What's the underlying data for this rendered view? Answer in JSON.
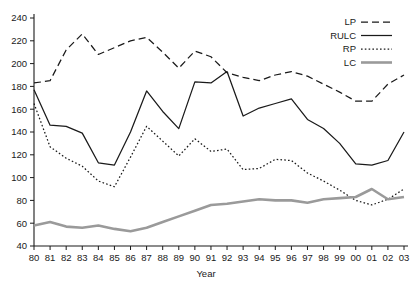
{
  "chart_data": {
    "type": "line",
    "title": "",
    "xlabel": "Year",
    "ylabel": "",
    "grid": false,
    "legend_position": "top-right",
    "categories": [
      "80",
      "81",
      "82",
      "83",
      "84",
      "85",
      "86",
      "87",
      "88",
      "89",
      "90",
      "91",
      "92",
      "93",
      "94",
      "95",
      "96",
      "97",
      "98",
      "99",
      "00",
      "01",
      "02",
      "03"
    ],
    "xlim": [
      0,
      23
    ],
    "ylim": [
      40,
      240
    ],
    "ytick_step": 20,
    "yticks": [
      40,
      60,
      80,
      100,
      120,
      140,
      160,
      180,
      200,
      220,
      240
    ],
    "series": [
      {
        "name": "LP",
        "style": "dashed",
        "color": "#1a1a1a",
        "values": [
          183,
          185,
          212,
          226,
          208,
          214,
          220,
          223,
          210,
          196,
          211,
          206,
          192,
          188,
          185,
          190,
          193,
          189,
          182,
          175,
          167,
          167,
          182,
          190
        ]
      },
      {
        "name": "RULC",
        "style": "solid",
        "color": "#1a1a1a",
        "values": [
          177,
          146,
          145,
          139,
          113,
          111,
          140,
          176,
          158,
          143,
          184,
          183,
          193,
          154,
          161,
          165,
          169,
          151,
          143,
          130,
          112,
          111,
          115,
          140
        ]
      },
      {
        "name": "RP",
        "style": "dotted",
        "color": "#1a1a1a",
        "values": [
          165,
          127,
          117,
          110,
          97,
          92,
          118,
          145,
          132,
          119,
          134,
          123,
          125,
          107,
          108,
          116,
          115,
          104,
          97,
          89,
          80,
          76,
          81,
          90
        ]
      },
      {
        "name": "LC",
        "style": "solid",
        "color": "#9a9a9a",
        "values": [
          58,
          61,
          57,
          56,
          58,
          55,
          53,
          56,
          61,
          66,
          71,
          76,
          77,
          79,
          81,
          80,
          80,
          78,
          81,
          82,
          83,
          90,
          81,
          83
        ]
      }
    ]
  },
  "legend": {
    "entries": [
      {
        "label": "LP"
      },
      {
        "label": "RULC"
      },
      {
        "label": "RP"
      },
      {
        "label": "LC"
      }
    ]
  }
}
